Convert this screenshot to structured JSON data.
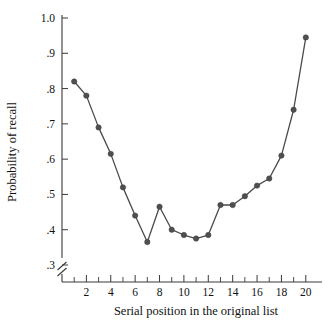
{
  "chart_data": {
    "type": "line",
    "title": "",
    "xlabel": "Serial position in the original list",
    "ylabel": "Probability of recall",
    "x": [
      1,
      2,
      3,
      4,
      5,
      6,
      7,
      8,
      9,
      10,
      11,
      12,
      13,
      14,
      15,
      16,
      17,
      18,
      19,
      20
    ],
    "values": [
      0.82,
      0.78,
      0.69,
      0.615,
      0.52,
      0.44,
      0.365,
      0.465,
      0.4,
      0.385,
      0.375,
      0.385,
      0.47,
      0.47,
      0.495,
      0.525,
      0.545,
      0.61,
      0.74,
      0.945
    ],
    "series": [
      {
        "name": "Probability of recall",
        "values": [
          0.82,
          0.78,
          0.69,
          0.615,
          0.52,
          0.44,
          0.365,
          0.465,
          0.4,
          0.385,
          0.375,
          0.385,
          0.47,
          0.47,
          0.495,
          0.525,
          0.545,
          0.61,
          0.74,
          0.945
        ]
      }
    ],
    "xlim": [
      0,
      21
    ],
    "ylim": [
      0.3,
      1.0
    ],
    "y_ticks": [
      0.3,
      0.4,
      0.5,
      0.6,
      0.7,
      0.8,
      0.9,
      1.0
    ],
    "y_tick_labels": [
      ".3",
      ".4",
      ".5",
      ".6",
      ".7",
      ".8",
      ".9",
      "1.0"
    ],
    "x_ticks_major": [
      2,
      4,
      6,
      8,
      10,
      12,
      14,
      16,
      18,
      20
    ],
    "x_tick_labels": [
      "2",
      "4",
      "6",
      "8",
      "10",
      "12",
      "14",
      "16",
      "18",
      "20"
    ],
    "x_ticks_minor": [
      1,
      3,
      5,
      7,
      9,
      11,
      13,
      15,
      17,
      19
    ],
    "grid": false,
    "legend": false,
    "legend_position": "none",
    "y_axis_break": true,
    "marker": "filled-circle",
    "line_color": "#4a4a4a",
    "marker_color": "#4f4f4f",
    "axis_color": "#3a3a3a",
    "background_color": "#ffffff"
  }
}
